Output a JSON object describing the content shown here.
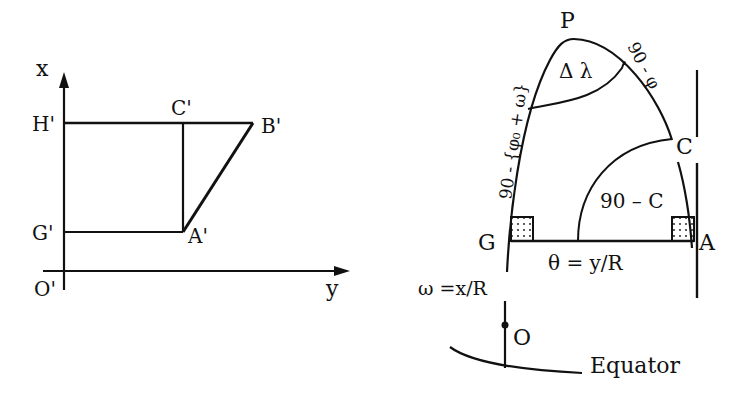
{
  "left_figure": {
    "axis_x_label": "x",
    "axis_y_label": "y",
    "origin_label": "O'",
    "points": {
      "H": "H'",
      "C": "C'",
      "B": "B'",
      "G": "G'",
      "A": "A'"
    }
  },
  "right_figure": {
    "pole_label": "P",
    "delta_lambda_label": "Δ λ",
    "left_side_label": "90 - {φ₀ + ω}",
    "right_side_label": "90 - φ",
    "point_c_label": "C",
    "angle_label": "90 – C",
    "point_g_label": "G",
    "point_a_label": "A",
    "theta_label": "θ = y/R",
    "omega_label": "ω =x/R",
    "point_o_label": "O",
    "equator_label": "Equator"
  }
}
